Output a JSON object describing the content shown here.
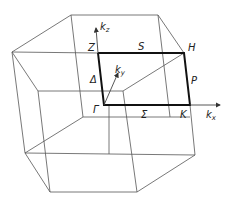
{
  "diagram": {
    "points": {
      "gamma": "Γ",
      "Z": "Z",
      "H": "H",
      "K": "K",
      "S": "S",
      "P": "P",
      "Delta": "Δ",
      "Sigma": "Σ"
    },
    "axes": {
      "kx": {
        "k": "k",
        "sub": "x"
      },
      "ky": {
        "k": "k",
        "sub": "y"
      },
      "kz": {
        "k": "k",
        "sub": "z"
      }
    },
    "colors": {
      "lines": "#555555",
      "path": "#111111"
    }
  }
}
